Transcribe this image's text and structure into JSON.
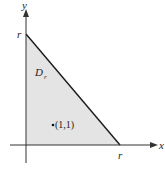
{
  "diagram": {
    "axes": {
      "x_label": "x",
      "y_label": "y"
    },
    "region": {
      "name": "D",
      "subscript": "r",
      "shape": "right-triangle",
      "vertices": [
        [
          0,
          0
        ],
        [
          "r",
          0
        ],
        [
          0,
          "r"
        ]
      ],
      "fill_color": "#e4e4e4",
      "edge_color": "#1a1a1a"
    },
    "intercepts": {
      "x_intercept_label": "r",
      "y_intercept_label": "r"
    },
    "point": {
      "label": "(1,1)",
      "x": 1,
      "y": 1
    }
  }
}
